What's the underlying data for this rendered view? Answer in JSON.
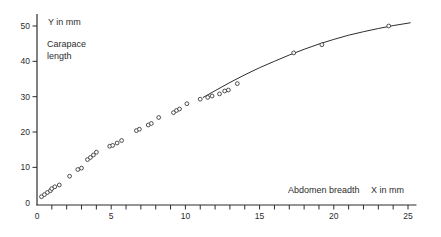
{
  "chart_data": {
    "type": "scatter",
    "title": "",
    "y_unit_label": "Y in mm",
    "ylabel_line1": "Carapace",
    "ylabel_line2": "length",
    "xlabel": "Abdomen breadth",
    "x_unit_label": "X in mm",
    "xlim": [
      0,
      25.3
    ],
    "ylim": [
      0,
      53.5
    ],
    "x_major_ticks": [
      0,
      5,
      10,
      15,
      20,
      25
    ],
    "x_minor_tick_step": 1,
    "y_major_ticks": [
      0,
      10,
      20,
      30,
      40,
      50
    ],
    "grid": "off",
    "legend": "none",
    "points": [
      [
        0.3,
        1.7
      ],
      [
        0.5,
        2.3
      ],
      [
        0.7,
        2.9
      ],
      [
        0.9,
        3.4
      ],
      [
        1.0,
        4.0
      ],
      [
        1.2,
        4.5
      ],
      [
        1.5,
        5.0
      ],
      [
        2.2,
        7.5
      ],
      [
        2.75,
        9.4
      ],
      [
        3.0,
        9.8
      ],
      [
        3.4,
        12.2
      ],
      [
        3.6,
        12.8
      ],
      [
        3.8,
        13.5
      ],
      [
        4.0,
        14.3
      ],
      [
        4.9,
        16.0
      ],
      [
        5.1,
        16.2
      ],
      [
        5.4,
        16.9
      ],
      [
        5.7,
        17.6
      ],
      [
        6.7,
        20.4
      ],
      [
        6.9,
        20.8
      ],
      [
        7.5,
        22.0
      ],
      [
        7.7,
        22.4
      ],
      [
        8.2,
        24.1
      ],
      [
        9.2,
        25.5
      ],
      [
        9.4,
        26.1
      ],
      [
        9.6,
        26.5
      ],
      [
        10.1,
        28.0
      ],
      [
        11.0,
        29.3
      ],
      [
        11.5,
        29.8
      ],
      [
        11.8,
        30.2
      ],
      [
        12.3,
        30.8
      ],
      [
        12.65,
        31.6
      ],
      [
        12.9,
        31.9
      ],
      [
        13.5,
        33.7
      ],
      [
        17.3,
        42.4
      ],
      [
        19.2,
        44.7
      ],
      [
        23.7,
        50.0
      ]
    ],
    "fitted_curve_points": [
      [
        11.2,
        29.8
      ],
      [
        12,
        31.7
      ],
      [
        13,
        34.0
      ],
      [
        14,
        36.2
      ],
      [
        15,
        38.2
      ],
      [
        16,
        40.0
      ],
      [
        17,
        41.8
      ],
      [
        18,
        43.4
      ],
      [
        19,
        44.9
      ],
      [
        20,
        46.2
      ],
      [
        21,
        47.4
      ],
      [
        22,
        48.4
      ],
      [
        23,
        49.3
      ],
      [
        24,
        50.1
      ],
      [
        25.15,
        50.9
      ]
    ],
    "style": {
      "axis_color": "#2d2d2d",
      "point_color": "#3a3a3a",
      "curve_color": "#2d2d2d",
      "background": "#ffffff"
    }
  }
}
